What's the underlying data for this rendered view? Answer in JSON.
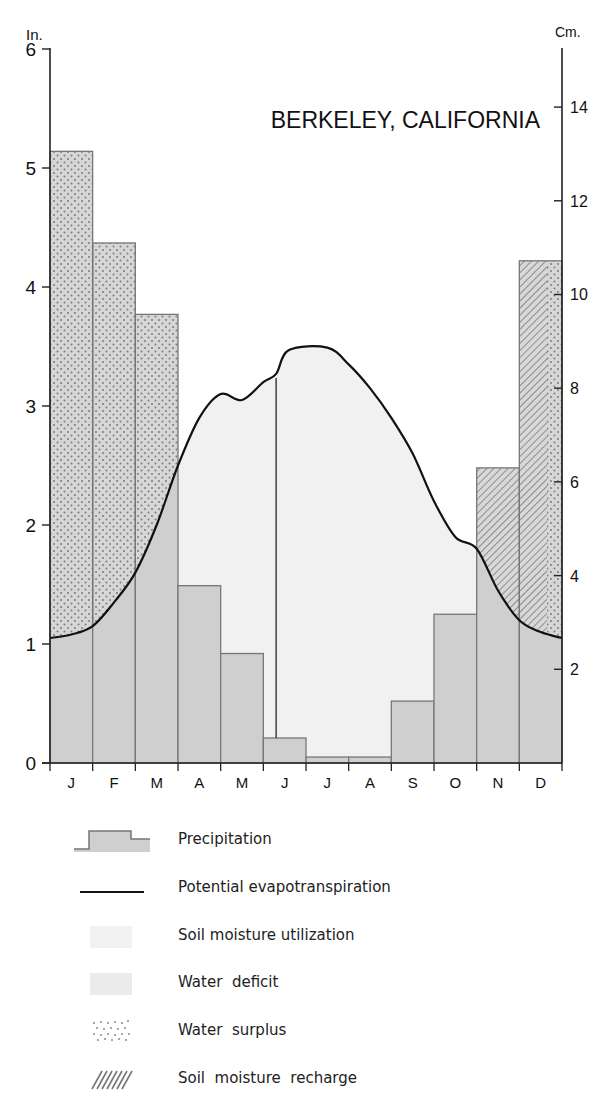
{
  "chart_data": {
    "type": "bar",
    "title": "BERKELEY, CALIFORNIA",
    "xlabel": "",
    "ylabel_left": "In.",
    "ylabel_right": "Cm.",
    "ylim_in": [
      0,
      6
    ],
    "ylim_cm": [
      0,
      15.24
    ],
    "left_ticks": [
      0,
      1,
      2,
      3,
      4,
      5,
      6
    ],
    "right_ticks": [
      2,
      4,
      6,
      8,
      10,
      12,
      14
    ],
    "categories": [
      "J",
      "F",
      "M",
      "A",
      "M",
      "J",
      "J",
      "A",
      "S",
      "O",
      "N",
      "D"
    ],
    "series": [
      {
        "name": "Precipitation",
        "kind": "bar",
        "values": [
          5.14,
          4.37,
          3.77,
          1.49,
          0.92,
          0.21,
          0.05,
          0.05,
          0.52,
          1.25,
          2.48,
          4.22
        ]
      },
      {
        "name": "Potential evapotranspiration",
        "kind": "line",
        "values": [
          1.15,
          1.4,
          1.95,
          2.65,
          3.1,
          3.4,
          3.5,
          3.3,
          2.8,
          2.1,
          1.4,
          1.1
        ]
      }
    ],
    "pe_curve_points_in": [
      [
        0,
        1.05
      ],
      [
        0.5,
        1.08
      ],
      [
        1,
        1.15
      ],
      [
        1.5,
        1.35
      ],
      [
        2,
        1.6
      ],
      [
        2.5,
        2.0
      ],
      [
        3,
        2.5
      ],
      [
        3.5,
        2.9
      ],
      [
        4,
        3.1
      ],
      [
        4.5,
        3.05
      ],
      [
        5,
        3.2
      ],
      [
        5.3,
        3.27
      ],
      [
        5.6,
        3.47
      ],
      [
        6.5,
        3.49
      ],
      [
        7,
        3.35
      ],
      [
        7.5,
        3.15
      ],
      [
        8,
        2.9
      ],
      [
        8.5,
        2.6
      ],
      [
        9,
        2.2
      ],
      [
        9.5,
        1.9
      ],
      [
        10,
        1.8
      ],
      [
        10.5,
        1.45
      ],
      [
        11,
        1.2
      ],
      [
        11.5,
        1.1
      ],
      [
        12,
        1.05
      ]
    ],
    "annotations": {
      "soil_moisture_utilization_end_month_index": 5.3,
      "december_surplus_start_fraction": 0.65
    },
    "legend_position": "bottom",
    "grid": false
  },
  "legend": [
    {
      "key": "precipitation",
      "label": "Precipitation"
    },
    {
      "key": "pe",
      "label": "Potential evapotranspiration"
    },
    {
      "key": "utilization",
      "label": "Soil moisture utilization"
    },
    {
      "key": "deficit",
      "label": "Water  deficit"
    },
    {
      "key": "surplus",
      "label": "Water  surplus"
    },
    {
      "key": "recharge",
      "label": "Soil  moisture  recharge"
    }
  ],
  "colors": {
    "precip": "#cfcfcf",
    "utilization": "#f1f1f1",
    "deficit": "#ececec",
    "surplus_dot": "#8a8a8a",
    "hatch": "#7a7a7a",
    "axis": "#222222",
    "pe_line": "#111111"
  }
}
